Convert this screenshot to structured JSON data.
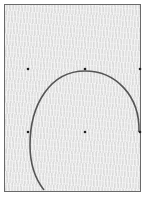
{
  "diagram": {
    "frame": {
      "x": 4,
      "y": 4,
      "width": 136,
      "height": 187,
      "stroke": "#6a6a6a",
      "fill": "#e4e4e4"
    },
    "points": [
      {
        "id": "p1",
        "x": 28,
        "y": 69
      },
      {
        "id": "p2",
        "x": 85,
        "y": 69
      },
      {
        "id": "p3",
        "x": 140,
        "y": 69
      },
      {
        "id": "p4",
        "x": 28,
        "y": 132
      },
      {
        "id": "p5",
        "x": 85,
        "y": 132
      },
      {
        "id": "p6",
        "x": 140,
        "y": 132
      }
    ],
    "curve": {
      "description": "Arc from right-middle point, over top point, down the left side to the bottom edge",
      "stroke": "#555555",
      "path": "M 139 132 C 140 95, 115 71, 85 71 C 50 71, 30 105, 30 145 C 30 165, 36 180, 44 190"
    },
    "point_color": "#222222"
  }
}
